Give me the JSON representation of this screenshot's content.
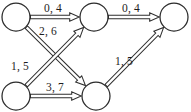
{
  "diagram": {
    "type": "flow-network",
    "node_radius": 14,
    "nodes": [
      {
        "id": "n1",
        "name": "node-top-left",
        "cx": 16,
        "cy": 17
      },
      {
        "id": "n2",
        "name": "node-top-middle",
        "cx": 94,
        "cy": 17
      },
      {
        "id": "n3",
        "name": "node-top-right",
        "cx": 174,
        "cy": 17
      },
      {
        "id": "n4",
        "name": "node-bottom-left",
        "cx": 16,
        "cy": 96
      },
      {
        "id": "n5",
        "name": "node-bottom-middle",
        "cx": 96,
        "cy": 96
      }
    ],
    "edges": [
      {
        "id": "e1",
        "name": "edge-top-left-to-top-middle",
        "from": "n1",
        "to": "n2",
        "label": "0, 4",
        "flow": 0,
        "capacity": 4,
        "label_x": 53,
        "label_y": 12
      },
      {
        "id": "e2",
        "name": "edge-top-middle-to-top-right",
        "from": "n2",
        "to": "n3",
        "label": "0, 4",
        "flow": 0,
        "capacity": 4,
        "label_x": 131,
        "label_y": 12
      },
      {
        "id": "e3",
        "name": "edge-top-left-to-bottom-middle",
        "from": "n1",
        "to": "n5",
        "label": "2, 6",
        "flow": 2,
        "capacity": 6,
        "label_x": 48,
        "label_y": 35
      },
      {
        "id": "e4",
        "name": "edge-bottom-left-to-top-middle",
        "from": "n4",
        "to": "n2",
        "label": "1, 5",
        "flow": 1,
        "capacity": 5,
        "label_x": 20,
        "label_y": 70
      },
      {
        "id": "e5",
        "name": "edge-bottom-left-to-bottom-middle",
        "from": "n4",
        "to": "n5",
        "label": "3, 7",
        "flow": 3,
        "capacity": 7,
        "label_x": 55,
        "label_y": 91
      },
      {
        "id": "e6",
        "name": "edge-bottom-middle-to-top-right",
        "from": "n5",
        "to": "n3",
        "label": "1, 5",
        "flow": 1,
        "capacity": 5,
        "label_x": 124,
        "label_y": 65
      }
    ],
    "colors": {
      "background": "#ffffff",
      "stroke": "#2f2f2f",
      "node_stroke": "#2b2b2b",
      "node_fill": "#ffffff",
      "label_text": "#1d1d1d"
    }
  }
}
